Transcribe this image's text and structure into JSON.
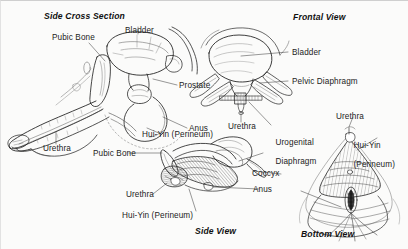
{
  "figure": {
    "kind": "anatomical-line-drawing",
    "style": "black-and-white pen-and-ink hatched illustration",
    "background_color": "#fbfbfa",
    "ink_color": "#1b1b1b",
    "panel_count": 4
  },
  "panels": {
    "side_cross_section": {
      "title": "Side Cross Section",
      "labels": {
        "pubic_bone": "Pubic Bone",
        "bladder": "Bladder",
        "prostate": "Prostate",
        "anus": "Anus",
        "hui_yin": "Hui-Yin (Perineum)",
        "urethra": "Urethra"
      }
    },
    "frontal_view": {
      "title": "Frontal View",
      "labels": {
        "bladder": "Bladder",
        "pelvic_diaphragm": "Pelvic Diaphragm",
        "urethra": "Urethra"
      }
    },
    "side_view": {
      "title": "Side View",
      "labels": {
        "pubic_bone": "Pubic Bone",
        "urethra": "Urethra",
        "urogenital_diaphragm_line1": "Urogenital",
        "urogenital_diaphragm_line2": "Diaphragm",
        "coccyx": "Coccyx",
        "anus": "Anus",
        "hui_yin": "Hui-Yin (Perineum)"
      }
    },
    "bottom_view": {
      "title": "Bottom View",
      "labels": {
        "urethra": "Urethra",
        "hui_yin_line1": "Hui-Yin",
        "hui_yin_line2": "(Perineum)"
      }
    }
  }
}
